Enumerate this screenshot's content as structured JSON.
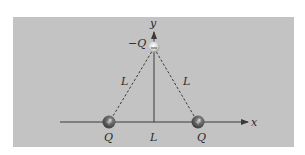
{
  "diagram": {
    "colors": {
      "background": "#ffffff",
      "panel": "#c3c3c3",
      "axis": "#3a3a3a",
      "dashed_line": "#3a3a3a",
      "charge_dark": "#5a5a5a",
      "charge_light": "#f2f2f2",
      "text": "#2a2a2a"
    },
    "axes": {
      "x_label": "x",
      "y_label": "y"
    },
    "charges": [
      {
        "id": "top",
        "label": "−Q",
        "sign": "negative",
        "symbol": "−"
      },
      {
        "id": "left",
        "label": "Q",
        "sign": "positive",
        "symbol": "+"
      },
      {
        "id": "right",
        "label": "Q",
        "sign": "positive",
        "symbol": "+"
      }
    ],
    "sides": {
      "left_label": "L",
      "right_label": "L",
      "base_label": "L"
    }
  }
}
